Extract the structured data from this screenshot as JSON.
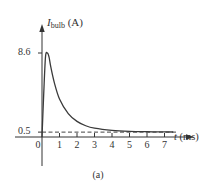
{
  "chart_data": {
    "type": "line",
    "title": "",
    "caption": "(a)",
    "xlabel": "t (ms)",
    "xlabel_var": "t",
    "xlabel_unit": "(ms)",
    "ylabel": "I_bulb (A)",
    "ylabel_var": "I",
    "ylabel_sub": "bulb",
    "ylabel_unit": "(A)",
    "xlim": [
      0,
      8
    ],
    "ylim": [
      0,
      8.6
    ],
    "x_ticks": [
      0,
      1,
      2,
      3,
      4,
      5,
      6,
      7
    ],
    "x_tick_labels": [
      "0",
      "1",
      "2",
      "3",
      "4",
      "5",
      "6",
      "7"
    ],
    "y_ticks": [
      0.5,
      8.6
    ],
    "y_tick_labels": [
      "0.5",
      "8.6"
    ],
    "grid": false,
    "legend": null,
    "series": [
      {
        "name": "I_bulb",
        "style": "solid",
        "x": [
          0,
          0.1,
          0.2,
          0.3,
          0.4,
          0.5,
          0.7,
          1.0,
          1.5,
          2.0,
          2.5,
          3.0,
          4.0,
          5.0,
          6.0,
          7.0,
          7.5
        ],
        "y": [
          0,
          4.5,
          8.2,
          8.6,
          8.2,
          7.2,
          5.6,
          3.9,
          2.4,
          1.6,
          1.15,
          0.9,
          0.68,
          0.58,
          0.54,
          0.52,
          0.51
        ]
      },
      {
        "name": "steady-state 0.5 A",
        "style": "dashed",
        "x": [
          0,
          7.5
        ],
        "y": [
          0.5,
          0.5
        ]
      }
    ],
    "annotations": [
      {
        "text": "8.6",
        "at": "y-axis peak value"
      },
      {
        "text": "0.5",
        "at": "steady-state value"
      }
    ]
  }
}
